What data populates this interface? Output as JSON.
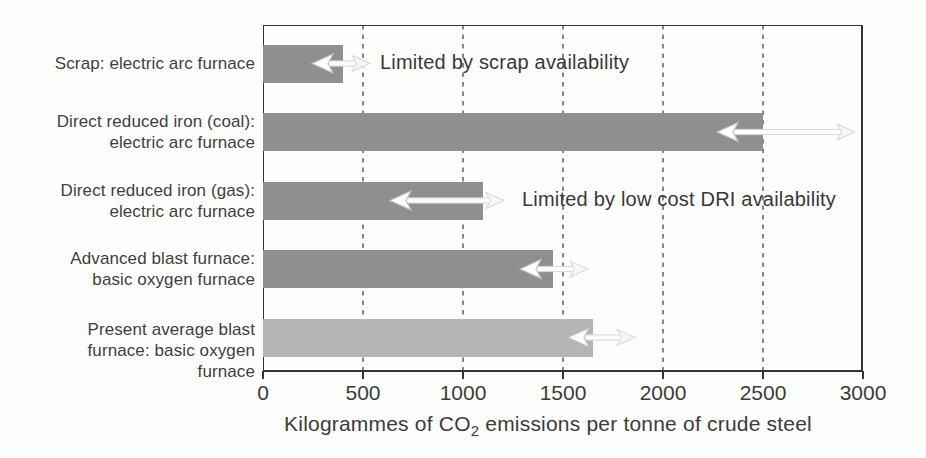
{
  "chart_data": {
    "type": "bar",
    "orientation": "horizontal",
    "xlabel_parts": {
      "prefix": "Kilogrammes of CO",
      "subscript": "2",
      "suffix": " emissions per tonne of crude steel"
    },
    "xlim": [
      0,
      3000
    ],
    "x_ticks": [
      0,
      500,
      1000,
      1500,
      2000,
      2500,
      3000
    ],
    "gridlines": {
      "style": "dashed",
      "values": [
        500,
        1000,
        1500,
        2000,
        2500
      ]
    },
    "bars": [
      {
        "id": "scrap-eaf",
        "label_lines": [
          "Scrap: electric arc furnace"
        ],
        "value": 400,
        "color": "#8f8f8f"
      },
      {
        "id": "dri-coal-eaf",
        "label_lines": [
          "Direct reduced iron (coal):",
          "electric arc furnace"
        ],
        "value": 2500,
        "color": "#8f8f8f"
      },
      {
        "id": "dri-gas-eaf",
        "label_lines": [
          "Direct reduced iron (gas):",
          "electric arc furnace"
        ],
        "value": 1100,
        "color": "#8f8f8f"
      },
      {
        "id": "advanced-bf-bof",
        "label_lines": [
          "Advanced blast furnace:",
          "basic oxygen furnace"
        ],
        "value": 1450,
        "color": "#8f8f8f"
      },
      {
        "id": "present-avg-bf-bof",
        "label_lines": [
          "Present average blast",
          "furnace: basic oxygen",
          "furnace"
        ],
        "value": 1650,
        "color": "#b5b5b5"
      }
    ],
    "annotations": [
      {
        "id": "scrap-note",
        "text": "Limited by scrap availability",
        "bar_index": 0,
        "x": 585
      },
      {
        "id": "dri-note",
        "text": "Limited by low cost DRI availability",
        "bar_index": 2,
        "x": 1295
      }
    ],
    "arrows": [
      {
        "bar_index": 0,
        "left_tip_x": 245,
        "right_tip_x": 535
      },
      {
        "bar_index": 1,
        "left_tip_x": 2270,
        "right_tip_x": 2960
      },
      {
        "bar_index": 2,
        "left_tip_x": 635,
        "right_tip_x": 1205
      },
      {
        "bar_index": 3,
        "left_tip_x": 1285,
        "right_tip_x": 1625
      },
      {
        "bar_index": 4,
        "left_tip_x": 1525,
        "right_tip_x": 1860
      }
    ],
    "colors": {
      "bar_default": "#8f8f8f",
      "bar_light": "#b5b5b5",
      "axis": "#333333",
      "grid": "#474747",
      "text": "#3b3b3b",
      "arrow_shaft_fill": "#fcfcfc",
      "arrow_shaft_stroke": "#d6d6d6",
      "arrow_head_fill": "#ffffff",
      "arrow_head_stroke": "#c3c3c3",
      "arrow_tail_fill": "#f6f6f6",
      "arrow_tail_stroke": "#dadada"
    }
  }
}
